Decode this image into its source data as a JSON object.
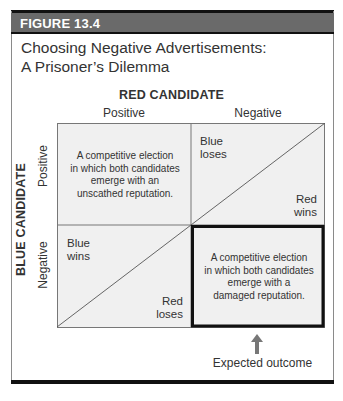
{
  "figure": {
    "label": "FIGURE 13.4",
    "title_line1": "Choosing Negative Advertisements:",
    "title_line2": "A Prisoner’s Dilemma"
  },
  "matrix": {
    "column_player": "RED CANDIDATE",
    "row_player": "BLUE CANDIDATE",
    "columns": [
      "Positive",
      "Negative"
    ],
    "rows": [
      "Positive",
      "Negative"
    ],
    "cells": {
      "positive_positive": {
        "line1": "A competitive election",
        "line2": "in which both candidates",
        "line3": "emerge with an",
        "line4": "unscathed reputation."
      },
      "positive_negative": {
        "blue_outcome_1": "Blue",
        "blue_outcome_2": "loses",
        "red_outcome_1": "Red",
        "red_outcome_2": "wins"
      },
      "negative_positive": {
        "blue_outcome_1": "Blue",
        "blue_outcome_2": "wins",
        "red_outcome_1": "Red",
        "red_outcome_2": "loses"
      },
      "negative_negative": {
        "line1": "A competitive election",
        "line2": "in which both candidates",
        "line3": "emerge with a",
        "line4": "damaged reputation."
      }
    },
    "highlighted_cell": "negative_negative",
    "annotation": "Expected outcome"
  },
  "colors": {
    "header_bg": "#6a6a6a",
    "cell_fill": "#f0f0f0",
    "grid_line": "#777777",
    "highlight_border": "#111111"
  }
}
